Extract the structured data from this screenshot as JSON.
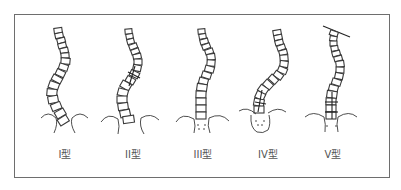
{
  "diagram": {
    "title": "",
    "frame_color": "#6e6e6e",
    "line_color": "#3a3a3a",
    "types": [
      {
        "id": "I",
        "label": "I型",
        "center_x": 65,
        "description": "S-curve, lumbar dominant"
      },
      {
        "id": "II",
        "label": "II型",
        "center_x": 133,
        "description": "S-curve with thoracic crossing line"
      },
      {
        "id": "III",
        "label": "III型",
        "center_x": 203,
        "description": "Single thoracic curve, centered pelvis"
      },
      {
        "id": "IV",
        "label": "IV型",
        "center_x": 268,
        "description": "Long thoracic curve tilting into L4"
      },
      {
        "id": "V",
        "label": "V型",
        "center_x": 335,
        "description": "Double thoracic curve, tilted T1 line"
      }
    ]
  }
}
